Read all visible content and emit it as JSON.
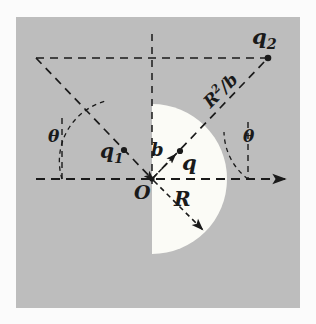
{
  "figure": {
    "name": "point-charge-image-sphere-diagram",
    "background_color": "#fdfdfd",
    "panel_color": "#bdbdbd",
    "disk_color": "#fbfbf6",
    "ink_color": "#1a1a1a",
    "panel": {
      "x": 16,
      "y": 17,
      "width": 284,
      "height": 291
    },
    "origin": {
      "x": 152,
      "y": 179
    },
    "disk_radius": 75
  },
  "labels": {
    "origin": "O",
    "charge_inside": "q",
    "charge_image": "q",
    "charge_image_sub": "1",
    "charge_outside": "q",
    "charge_outside_sub": "2",
    "impact_parameter": "b",
    "radius": "R",
    "inverse_point": "R",
    "inverse_point_sup": "2",
    "inverse_point_rest": "/b",
    "angle_left": "θ",
    "angle_right": "θ"
  },
  "markers": [
    {
      "name": "point-q1",
      "x": 124,
      "y": 150
    },
    {
      "name": "point-q",
      "x": 180,
      "y": 151
    },
    {
      "name": "point-q2",
      "x": 268,
      "y": 58
    },
    {
      "name": "point-origin",
      "x": 152,
      "y": 179
    }
  ],
  "lines": {
    "axis_horizontal": {
      "x1": 36,
      "y1": 179,
      "x2": 292,
      "y2": 179,
      "arrow": "right"
    },
    "axis_vertical": {
      "x1": 152,
      "y1": 34,
      "x2": 152,
      "y2": 185
    },
    "top_horizontal": {
      "x1": 36,
      "y1": 58,
      "x2": 266,
      "y2": 58
    },
    "left_vertical": {
      "x1": 62,
      "y1": 118,
      "x2": 62,
      "y2": 179
    },
    "right_vertical": {
      "x1": 248,
      "y1": 120,
      "x2": 248,
      "y2": 179
    },
    "ray_q1_to_q2": {
      "x1": 36,
      "y1": 58,
      "x2": 152,
      "y2": 179
    },
    "ray_o_to_q2": {
      "x1": 152,
      "y1": 179,
      "x2": 266,
      "y2": 60
    },
    "radius_arrow": {
      "x1": 152,
      "y1": 179,
      "x2": 206,
      "y2": 233
    },
    "b_arrow": {
      "x1": 152,
      "y1": 179,
      "x2": 178,
      "y2": 152
    }
  },
  "arcs": {
    "left_angle_arc": {
      "cx": 36,
      "cy": 179,
      "r": 62,
      "note": "from vertical x=62 up to ray"
    },
    "right_angle_arc": {
      "cx": 266,
      "cy": 179,
      "r": 60,
      "note": "from axis x=248 up to ray"
    }
  }
}
